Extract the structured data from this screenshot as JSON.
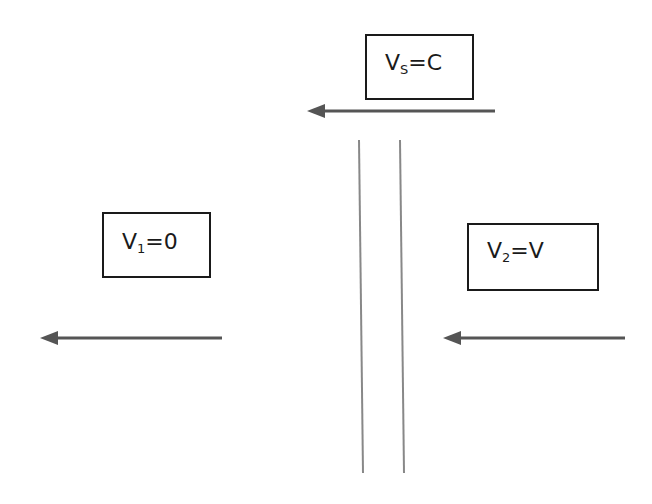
{
  "diagram": {
    "boxes": [
      {
        "id": "vs",
        "var": "V",
        "sub": "S",
        "rhs": "=C"
      },
      {
        "id": "v1",
        "var": "V",
        "sub": "1",
        "rhs": "=0"
      },
      {
        "id": "v2",
        "var": "V",
        "sub": "2",
        "rhs": "=V"
      }
    ],
    "arrows": [
      {
        "id": "top",
        "direction": "left"
      },
      {
        "id": "left",
        "direction": "left"
      },
      {
        "id": "right",
        "direction": "left"
      }
    ],
    "wall": {
      "lines": 2
    },
    "colors": {
      "arrow": "#555555",
      "wall": "#888888",
      "box_border": "#1a1a1a"
    }
  }
}
